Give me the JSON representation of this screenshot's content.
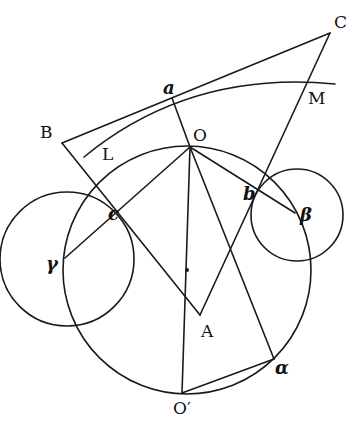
{
  "diagram": {
    "type": "geometric-construction",
    "colors": {
      "ink": "#1a1a1a",
      "background": "#ffffff"
    },
    "points": {
      "C": {
        "label": "C",
        "x": 330,
        "y": 33
      },
      "a": {
        "label": "a",
        "x": 172,
        "y": 98
      },
      "B": {
        "label": "B",
        "x": 62,
        "y": 143
      },
      "M": {
        "label": "M",
        "x": 305,
        "y": 83
      },
      "L": {
        "label": "L",
        "x": 84,
        "y": 157
      },
      "O": {
        "label": "O",
        "x": 190,
        "y": 147
      },
      "b": {
        "label": "b",
        "x": 258,
        "y": 187
      },
      "beta": {
        "label": "β",
        "x": 295,
        "y": 213
      },
      "c": {
        "label": "c",
        "x": 117,
        "y": 202
      },
      "gamma": {
        "label": "γ",
        "x": 65,
        "y": 258
      },
      "A": {
        "label": "A",
        "x": 200,
        "y": 315
      },
      "O_prime": {
        "label": "O′",
        "x": 182,
        "y": 393
      },
      "alpha": {
        "label": "α",
        "x": 274,
        "y": 359
      }
    },
    "labels": {
      "C": "C",
      "a": "a",
      "B": "B",
      "M": "M",
      "L": "L",
      "O": "O",
      "b": "b",
      "beta": "β",
      "c": "c",
      "gamma": "γ",
      "A": "A",
      "O_prime": "O′",
      "alpha": "α"
    },
    "circles": [
      {
        "name": "main-circle",
        "cx": 187,
        "cy": 270,
        "r": 124
      },
      {
        "name": "circle-beta",
        "cx": 297,
        "cy": 215,
        "r": 46
      },
      {
        "name": "circle-gamma",
        "cx": 67,
        "cy": 259,
        "r": 67
      }
    ],
    "segments": [
      [
        "C",
        "B"
      ],
      [
        "B",
        "A"
      ],
      [
        "C",
        "A"
      ],
      [
        "a",
        "O"
      ],
      [
        "O",
        "gamma"
      ],
      [
        "O",
        "beta"
      ],
      [
        "O",
        "O_prime"
      ],
      [
        "O",
        "alpha"
      ],
      [
        "O_prime",
        "alpha"
      ]
    ],
    "arcs": [
      {
        "name": "arc-LM",
        "through": [
          "L",
          "a",
          "M"
        ]
      }
    ]
  }
}
